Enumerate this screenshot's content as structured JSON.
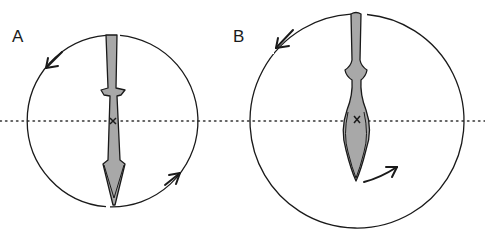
{
  "diagram": {
    "type": "rotation-comparison",
    "axis_line": {
      "style": "dotted",
      "y": 121
    },
    "panels": [
      {
        "id": "A",
        "label": "A",
        "circle": {
          "cx": 113,
          "cy": 121,
          "r": 86
        },
        "object": "spear-shaped blade with narrow shaft, small cross-guard and long pointed tip",
        "center_mark": "×",
        "rotation_arrows": [
          "counter-clockwise arrow at upper-left",
          "arrow at lower-right"
        ]
      },
      {
        "id": "B",
        "label": "B",
        "circle": {
          "cx": 357,
          "cy": 121,
          "r": 107
        },
        "object": "leaf-shaped blade with narrow shaft and rounded collar",
        "center_mark": "×",
        "rotation_arrows": [
          "counter-clockwise arrow at upper-left",
          "arrow at lower-right near tip"
        ]
      }
    ],
    "colors": {
      "stroke": "#1a1a1a",
      "fill": "#a8a8a8",
      "background": "#ffffff"
    }
  }
}
